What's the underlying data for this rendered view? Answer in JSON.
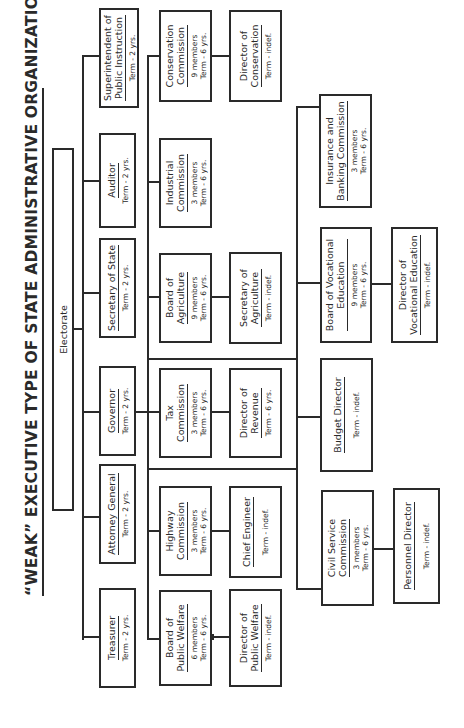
{
  "title": "“WEAK” EXECUTIVE TYPE OF STATE ADMINISTRATIVE ORGANIZATION",
  "electorate": {
    "label": "Electorate"
  },
  "elected_officials": [
    {
      "id": "treasurer",
      "name": [
        "Treasurer"
      ],
      "term": "Term - 2 yrs."
    },
    {
      "id": "attorney-general",
      "name": [
        "Attorney General"
      ],
      "term": "Term - 2 yrs."
    },
    {
      "id": "governor",
      "name": [
        "Governor"
      ],
      "term": "Term - 2 yrs."
    },
    {
      "id": "secretary-of-state",
      "name": [
        "Secretary of State"
      ],
      "term": "Term - 2 yrs."
    },
    {
      "id": "auditor",
      "name": [
        "Auditor"
      ],
      "term": "Term - 2 yrs."
    },
    {
      "id": "superintendent",
      "name": [
        "Superintendent of",
        "Public Instruction"
      ],
      "term": "Term - 2 yrs."
    }
  ],
  "boards": [
    {
      "id": "board-public-welfare",
      "name": [
        "Board of",
        "Public Welfare"
      ],
      "members": "6 members",
      "term": "Term - 6 yrs."
    },
    {
      "id": "highway-commission",
      "name": [
        "Highway",
        "Commission"
      ],
      "members": "3 members",
      "term": "Term - 6 yrs."
    },
    {
      "id": "tax-commission",
      "name": [
        "Tax",
        "Commission"
      ],
      "members": "3 members",
      "term": "Term - 6 yrs."
    },
    {
      "id": "board-agriculture",
      "name": [
        "Board of",
        "Agriculture"
      ],
      "members": "9 members",
      "term": "Term - 6 yrs."
    },
    {
      "id": "industrial-commission",
      "name": [
        "Industrial",
        "Commission"
      ],
      "members": "3 members",
      "term": "Term - 6 yrs."
    },
    {
      "id": "conservation-commission",
      "name": [
        "Conservation",
        "Commission"
      ],
      "members": "9 members",
      "term": "Term - 6 yrs."
    }
  ],
  "directors": [
    {
      "id": "director-public-welfare",
      "name": [
        "Director of",
        "Public Welfare"
      ],
      "term": "Term - indef."
    },
    {
      "id": "chief-engineer",
      "name": [
        "Chief Engineer"
      ],
      "term": "Term - indef."
    },
    {
      "id": "director-revenue",
      "name": [
        "Director of",
        "Revenue"
      ],
      "term": "Term - 6 yrs."
    },
    {
      "id": "secretary-agriculture",
      "name": [
        "Secretary of",
        "Agriculture"
      ],
      "term": "Term - indef."
    },
    {
      "id": "director-conservation",
      "name": [
        "Director of",
        "Conservation"
      ],
      "term": "Term - indef."
    }
  ],
  "lower_boards": [
    {
      "id": "civil-service-commission",
      "name": [
        "Civil Service",
        "Commission"
      ],
      "members": "3 members",
      "term": "Term - 6 yrs."
    },
    {
      "id": "budget-director",
      "name": [
        "Budget Director"
      ],
      "term": "Term - indef."
    },
    {
      "id": "board-vocational-education",
      "name": [
        "Board of Vocational",
        "Education"
      ],
      "members": "9 members",
      "term": "Term - 6 yrs."
    },
    {
      "id": "insurance-banking-commission",
      "name": [
        "Insurance and",
        "Banking Commission"
      ],
      "members": "3 members",
      "term": "Term - 6 yrs."
    }
  ],
  "lower_directors": [
    {
      "id": "personnel-director",
      "name": [
        "Personnel Director"
      ],
      "term": "Term - indef."
    },
    {
      "id": "director-vocational-education",
      "name": [
        "Director of",
        "Vocational Education"
      ],
      "term": "Term - indef."
    }
  ]
}
